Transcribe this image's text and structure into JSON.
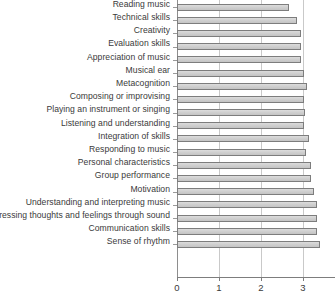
{
  "chart_data": {
    "type": "bar",
    "orientation": "horizontal",
    "title": "",
    "subtitle": "",
    "xlabel": "",
    "ylabel": "",
    "xlim": [
      0,
      4
    ],
    "grid": true,
    "legend": false,
    "legend_position": "none",
    "xticks": [
      "0",
      "1",
      "2",
      "3",
      "4"
    ],
    "xtick_values": [
      0,
      1,
      2,
      3,
      4
    ],
    "note": "The x axis is clipped at the right edge of the image; the tick for 4 is cut off.",
    "categories": [
      "Reading music",
      "Technical skills",
      "Creativity",
      "Evaluation skills",
      "Appreciation of music",
      "Musical ear",
      "Metacognition",
      "Composing or improvising",
      "Playing an instrument or singing",
      "Listening and understanding",
      "Integration of skills",
      "Responding to music",
      "Personal characteristics",
      "Group performance",
      "Motivation",
      "Understanding and interpreting music",
      "Expressing thoughts and feelings through sound",
      "Communication skills",
      "Sense of rhythm"
    ],
    "values": [
      2.67,
      2.86,
      2.95,
      2.95,
      2.95,
      3.02,
      3.09,
      3.02,
      3.04,
      3.02,
      3.14,
      3.07,
      3.19,
      3.19,
      3.26,
      3.33,
      3.33,
      3.33,
      3.4
    ],
    "series": [
      {
        "name": "Mean rating",
        "values": [
          2.67,
          2.86,
          2.95,
          2.95,
          2.95,
          3.02,
          3.09,
          3.02,
          3.04,
          3.02,
          3.14,
          3.07,
          3.19,
          3.19,
          3.26,
          3.33,
          3.33,
          3.33,
          3.4
        ]
      }
    ],
    "colors": {
      "bar_fill": "#d2d2d2",
      "bar_edge": "#7d7d7d",
      "gridline": "#c9c9c9",
      "axis": "#7d7d7d",
      "text": "#3a3a3a"
    }
  }
}
